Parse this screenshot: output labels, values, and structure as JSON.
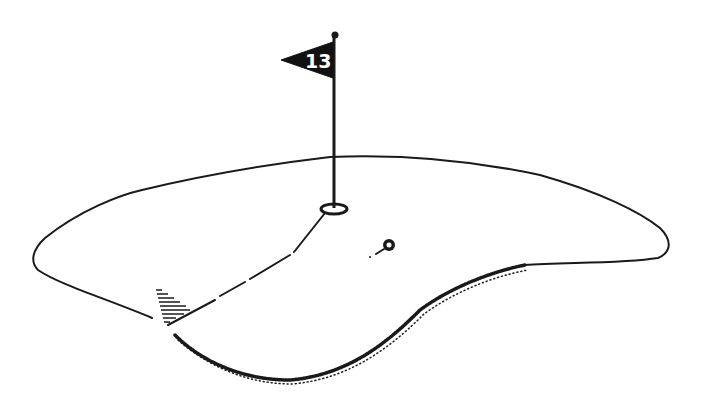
{
  "illustration": {
    "subject": "golf green with flagstick, ball and tee marker",
    "flag": {
      "number": "13",
      "color": "#111111",
      "text_color": "#ffffff"
    },
    "colors": {
      "background": "#ffffff",
      "ink": "#1a1a1a"
    },
    "elements": [
      "green-outline",
      "flagstick",
      "flag",
      "cup",
      "ball",
      "putt-line",
      "tee-marker",
      "shadow-edge"
    ]
  }
}
